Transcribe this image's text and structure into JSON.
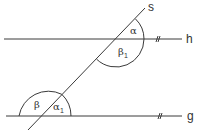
{
  "diagram": {
    "lines": {
      "s": {
        "label": "s"
      },
      "h": {
        "label": "h"
      },
      "g": {
        "label": "g"
      }
    },
    "angles": {
      "alpha": {
        "symbol": "α",
        "subscript": ""
      },
      "beta1": {
        "symbol": "β",
        "subscript": "1"
      },
      "beta": {
        "symbol": "β",
        "subscript": ""
      },
      "alpha1": {
        "symbol": "α",
        "subscript": "1"
      }
    },
    "parallel_mark": "#",
    "colors": {
      "stroke": "#3a3a3a",
      "background": "#ffffff"
    }
  }
}
